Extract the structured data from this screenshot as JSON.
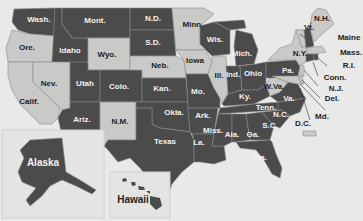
{
  "colors": {
    "background": "#e9e9e7",
    "dark": "#4b4b4b",
    "light": "#c9c9c7",
    "border": "#8a8a8a"
  },
  "legend_swatch": {
    "label": "D.C.",
    "category": "light"
  },
  "states": [
    {
      "id": "wa",
      "label": "Wash.",
      "category": "dark"
    },
    {
      "id": "or",
      "label": "Ore.",
      "category": "light"
    },
    {
      "id": "ca",
      "label": "Calif.",
      "category": "light"
    },
    {
      "id": "id",
      "label": "Idaho",
      "category": "dark"
    },
    {
      "id": "nv",
      "label": "Nev.",
      "category": "light"
    },
    {
      "id": "mt",
      "label": "Mont.",
      "category": "dark"
    },
    {
      "id": "wy",
      "label": "Wyo.",
      "category": "light"
    },
    {
      "id": "ut",
      "label": "Utah",
      "category": "dark"
    },
    {
      "id": "az",
      "label": "Ariz.",
      "category": "dark"
    },
    {
      "id": "co",
      "label": "Colo.",
      "category": "dark"
    },
    {
      "id": "nm",
      "label": "N.M.",
      "category": "light"
    },
    {
      "id": "nd",
      "label": "N.D.",
      "category": "dark"
    },
    {
      "id": "sd",
      "label": "S.D.",
      "category": "dark"
    },
    {
      "id": "ne",
      "label": "Neb.",
      "category": "light"
    },
    {
      "id": "ks",
      "label": "Kan.",
      "category": "dark"
    },
    {
      "id": "ok",
      "label": "Okla.",
      "category": "dark"
    },
    {
      "id": "tx",
      "label": "Texas",
      "category": "dark"
    },
    {
      "id": "mn",
      "label": "Minn.",
      "category": "light"
    },
    {
      "id": "ia",
      "label": "Iowa",
      "category": "light"
    },
    {
      "id": "mo",
      "label": "Mo.",
      "category": "dark"
    },
    {
      "id": "ar",
      "label": "Ark.",
      "category": "dark"
    },
    {
      "id": "la",
      "label": "La.",
      "category": "dark"
    },
    {
      "id": "wi",
      "label": "Wis.",
      "category": "dark"
    },
    {
      "id": "il",
      "label": "Ill.",
      "category": "light"
    },
    {
      "id": "mi",
      "label": "Mich.",
      "category": "dark"
    },
    {
      "id": "in",
      "label": "Ind.",
      "category": "dark"
    },
    {
      "id": "oh",
      "label": "Ohio",
      "category": "dark"
    },
    {
      "id": "ky",
      "label": "Ky.",
      "category": "dark"
    },
    {
      "id": "tn",
      "label": "Tenn.",
      "category": "dark"
    },
    {
      "id": "ms",
      "label": "Miss.",
      "category": "dark"
    },
    {
      "id": "al",
      "label": "Ala.",
      "category": "dark"
    },
    {
      "id": "ga",
      "label": "Ga.",
      "category": "dark"
    },
    {
      "id": "fl",
      "label": "Fla.",
      "category": "dark"
    },
    {
      "id": "sc",
      "label": "S.C.",
      "category": "dark"
    },
    {
      "id": "nc",
      "label": "N.C.",
      "category": "dark"
    },
    {
      "id": "va",
      "label": "Va.",
      "category": "dark"
    },
    {
      "id": "wv",
      "label": "W.Va.",
      "category": "light"
    },
    {
      "id": "pa",
      "label": "Pa.",
      "category": "dark"
    },
    {
      "id": "ny",
      "label": "N.Y.",
      "category": "light"
    },
    {
      "id": "vt",
      "label": "Vt.",
      "category": "light"
    },
    {
      "id": "nh",
      "label": "N.H.",
      "category": "dark"
    },
    {
      "id": "me",
      "label": "Maine",
      "category": "light"
    },
    {
      "id": "ma",
      "label": "Mass.",
      "category": "light"
    },
    {
      "id": "ri",
      "label": "R.I.",
      "category": "dark"
    },
    {
      "id": "ct",
      "label": "Conn.",
      "category": "dark"
    },
    {
      "id": "nj",
      "label": "N.J.",
      "category": "light"
    },
    {
      "id": "de",
      "label": "Del.",
      "category": "light"
    },
    {
      "id": "md",
      "label": "Md.",
      "category": "light"
    },
    {
      "id": "dc",
      "label": "D.C.",
      "category": "light"
    },
    {
      "id": "ak",
      "label": "Alaska",
      "category": "dark"
    },
    {
      "id": "hi",
      "label": "Hawaii",
      "category": "dark"
    }
  ]
}
